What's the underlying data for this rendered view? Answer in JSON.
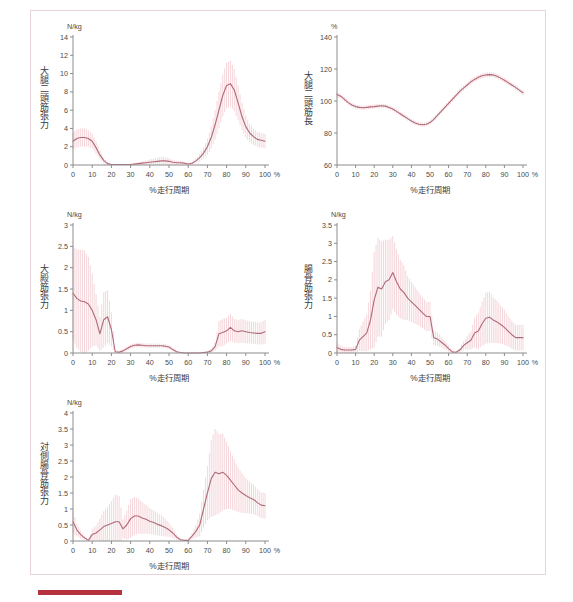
{
  "figure": {
    "accent_color": "#b5333f",
    "line_color": "#b06a78",
    "error_color": "#f0c8cf",
    "axis_color": "#8c8c8c",
    "xlabel": "%走行周期",
    "x_unit_suffix": "%",
    "x_ticks": [
      0,
      10,
      20,
      30,
      40,
      50,
      60,
      70,
      80,
      90,
      100
    ]
  },
  "chart_data": [
    {
      "id": "biceps-femoris-force",
      "type": "line",
      "title": "大腿二頭筋張力",
      "ylabel": "大腿二頭筋張力",
      "xlabel": "%走行周期",
      "yunit": "N/kg",
      "ylim": [
        0,
        14
      ],
      "y_ticks": [
        0,
        2,
        4,
        6,
        8,
        10,
        12,
        14
      ],
      "xlim": [
        0,
        100
      ],
      "grid": false,
      "legend": "none",
      "x": [
        0,
        2,
        4,
        6,
        8,
        10,
        12,
        14,
        16,
        18,
        20,
        22,
        24,
        26,
        28,
        30,
        32,
        34,
        36,
        38,
        40,
        42,
        44,
        46,
        48,
        50,
        52,
        54,
        56,
        58,
        60,
        62,
        64,
        66,
        68,
        70,
        72,
        74,
        76,
        78,
        80,
        82,
        84,
        86,
        88,
        90,
        92,
        94,
        96,
        98,
        100
      ],
      "mean": [
        2.6,
        2.9,
        3.0,
        3.0,
        2.9,
        2.6,
        1.9,
        1.1,
        0.5,
        0.15,
        0.05,
        0.05,
        0.05,
        0.05,
        0.05,
        0.05,
        0.1,
        0.15,
        0.2,
        0.25,
        0.3,
        0.35,
        0.4,
        0.45,
        0.45,
        0.4,
        0.3,
        0.25,
        0.25,
        0.2,
        0.1,
        0.2,
        0.45,
        0.8,
        1.3,
        2.0,
        3.0,
        4.4,
        6.0,
        7.6,
        8.7,
        8.9,
        8.2,
        6.8,
        5.3,
        4.2,
        3.5,
        3.1,
        2.8,
        2.7,
        2.6
      ],
      "err": [
        0.9,
        1.0,
        1.0,
        1.0,
        0.9,
        0.8,
        0.7,
        0.5,
        0.3,
        0.15,
        0.05,
        0.05,
        0.05,
        0.05,
        0.05,
        0.05,
        0.1,
        0.15,
        0.2,
        0.25,
        0.3,
        0.35,
        0.4,
        0.45,
        0.4,
        0.35,
        0.25,
        0.2,
        0.2,
        0.15,
        0.1,
        0.15,
        0.25,
        0.4,
        0.6,
        0.9,
        1.2,
        1.6,
        2.0,
        2.3,
        2.5,
        2.5,
        2.3,
        1.9,
        1.5,
        1.2,
        1.0,
        0.9,
        0.8,
        0.8,
        0.8
      ]
    },
    {
      "id": "biceps-femoris-length",
      "type": "line",
      "title": "大腿二頭筋長",
      "ylabel": "大腿二頭筋長",
      "xlabel": "%走行周期",
      "yunit": "%",
      "ylim": [
        60,
        140
      ],
      "y_ticks": [
        60,
        80,
        100,
        120,
        140
      ],
      "xlim": [
        0,
        100
      ],
      "grid": false,
      "legend": "none",
      "x": [
        0,
        2,
        4,
        6,
        8,
        10,
        12,
        14,
        16,
        18,
        20,
        22,
        24,
        26,
        28,
        30,
        32,
        34,
        36,
        38,
        40,
        42,
        44,
        46,
        48,
        50,
        52,
        54,
        56,
        58,
        60,
        62,
        64,
        66,
        68,
        70,
        72,
        74,
        76,
        78,
        80,
        82,
        84,
        86,
        88,
        90,
        92,
        94,
        96,
        98,
        100
      ],
      "mean": [
        104,
        103,
        101,
        99,
        97.5,
        96.5,
        96,
        95.8,
        96,
        96.3,
        96.5,
        96.8,
        97,
        96.8,
        96,
        95,
        93.5,
        92,
        90.5,
        89,
        87.5,
        86.3,
        85.5,
        85.2,
        85.5,
        86.5,
        88.5,
        91,
        93.5,
        96,
        98.5,
        101,
        103.5,
        106,
        108,
        110,
        112,
        113.5,
        114.8,
        115.8,
        116.3,
        116.5,
        116.3,
        115.5,
        114.3,
        113,
        111.5,
        110,
        108.5,
        106.8,
        105.2
      ],
      "err": [
        1.6,
        1.5,
        1.4,
        1.4,
        1.3,
        1.3,
        1.3,
        1.3,
        1.3,
        1.3,
        1.3,
        1.3,
        1.3,
        1.3,
        1.3,
        1.3,
        1.3,
        1.3,
        1.3,
        1.3,
        1.3,
        1.3,
        1.3,
        1.3,
        1.3,
        1.3,
        1.4,
        1.4,
        1.5,
        1.5,
        1.5,
        1.6,
        1.6,
        1.6,
        1.6,
        1.6,
        1.6,
        1.6,
        1.6,
        1.6,
        1.6,
        1.6,
        1.6,
        1.6,
        1.5,
        1.5,
        1.5,
        1.4,
        1.4,
        1.4,
        1.4
      ]
    },
    {
      "id": "gluteus-maximus-force",
      "type": "line",
      "title": "大殿筋張力",
      "ylabel": "大殿筋張力",
      "xlabel": "%走行周期",
      "yunit": "N/kg",
      "ylim": [
        0,
        3
      ],
      "y_ticks": [
        0,
        0.5,
        1,
        1.5,
        2,
        2.5,
        3
      ],
      "xlim": [
        0,
        100
      ],
      "grid": false,
      "legend": "none",
      "x": [
        0,
        2,
        4,
        6,
        8,
        10,
        12,
        14,
        16,
        18,
        20,
        22,
        24,
        26,
        28,
        30,
        32,
        34,
        36,
        38,
        40,
        42,
        44,
        46,
        48,
        50,
        52,
        54,
        56,
        58,
        60,
        62,
        64,
        66,
        68,
        70,
        72,
        74,
        76,
        78,
        80,
        82,
        84,
        86,
        88,
        90,
        92,
        94,
        96,
        98,
        100
      ],
      "mean": [
        1.4,
        1.28,
        1.22,
        1.2,
        1.15,
        1.0,
        0.78,
        0.45,
        0.78,
        0.85,
        0.55,
        0.03,
        0.02,
        0.05,
        0.1,
        0.15,
        0.18,
        0.19,
        0.18,
        0.17,
        0.17,
        0.17,
        0.17,
        0.17,
        0.16,
        0.14,
        0.08,
        0.03,
        0.01,
        0.0,
        0.0,
        0.0,
        0.0,
        0.0,
        0.01,
        0.02,
        0.05,
        0.15,
        0.45,
        0.48,
        0.52,
        0.6,
        0.52,
        0.5,
        0.52,
        0.5,
        0.48,
        0.47,
        0.46,
        0.46,
        0.5
      ],
      "err": [
        1.1,
        1.15,
        1.2,
        1.2,
        1.1,
        0.85,
        0.6,
        0.4,
        0.65,
        0.62,
        0.4,
        0.04,
        0.03,
        0.04,
        0.05,
        0.05,
        0.05,
        0.05,
        0.05,
        0.05,
        0.05,
        0.05,
        0.05,
        0.05,
        0.05,
        0.05,
        0.04,
        0.02,
        0.01,
        0.0,
        0.0,
        0.0,
        0.0,
        0.0,
        0.01,
        0.02,
        0.04,
        0.1,
        0.3,
        0.32,
        0.3,
        0.32,
        0.28,
        0.27,
        0.28,
        0.27,
        0.26,
        0.26,
        0.26,
        0.26,
        0.28
      ]
    },
    {
      "id": "iliacus-force",
      "type": "line",
      "title": "腸骨筋張力",
      "ylabel": "腸骨筋張力",
      "xlabel": "%走行周期",
      "yunit": "N/kg",
      "ylim": [
        0,
        3.5
      ],
      "y_ticks": [
        0,
        0.5,
        1,
        1.5,
        2,
        2.5,
        3,
        3.5
      ],
      "xlim": [
        0,
        100
      ],
      "grid": false,
      "legend": "none",
      "x": [
        0,
        2,
        4,
        6,
        8,
        10,
        12,
        14,
        16,
        18,
        20,
        22,
        24,
        26,
        28,
        30,
        32,
        34,
        36,
        38,
        40,
        42,
        44,
        46,
        48,
        50,
        52,
        54,
        56,
        58,
        60,
        62,
        64,
        66,
        68,
        70,
        72,
        74,
        76,
        78,
        80,
        82,
        84,
        86,
        88,
        90,
        92,
        94,
        96,
        98,
        100
      ],
      "mean": [
        0.15,
        0.1,
        0.08,
        0.08,
        0.08,
        0.1,
        0.35,
        0.45,
        0.55,
        0.9,
        1.45,
        1.8,
        1.75,
        1.95,
        2.0,
        2.2,
        1.95,
        1.75,
        1.65,
        1.5,
        1.4,
        1.3,
        1.2,
        1.1,
        1.0,
        1.0,
        0.42,
        0.38,
        0.3,
        0.22,
        0.12,
        0.03,
        0.02,
        0.08,
        0.2,
        0.28,
        0.35,
        0.55,
        0.6,
        0.8,
        0.95,
        0.98,
        0.9,
        0.85,
        0.78,
        0.7,
        0.6,
        0.5,
        0.42,
        0.42,
        0.42
      ],
      "err": [
        0.12,
        0.1,
        0.08,
        0.08,
        0.08,
        0.1,
        0.3,
        0.4,
        0.5,
        0.8,
        1.3,
        1.35,
        1.3,
        1.15,
        1.1,
        1.0,
        0.9,
        0.8,
        0.75,
        0.6,
        0.55,
        0.5,
        0.45,
        0.42,
        0.4,
        0.4,
        0.2,
        0.18,
        0.15,
        0.12,
        0.08,
        0.03,
        0.02,
        0.06,
        0.12,
        0.18,
        0.25,
        0.4,
        0.5,
        0.6,
        0.7,
        0.7,
        0.62,
        0.58,
        0.52,
        0.48,
        0.42,
        0.38,
        0.35,
        0.35,
        0.35
      ]
    },
    {
      "id": "contralateral-iliacus-force",
      "type": "line",
      "title": "対側腸骨筋張力",
      "ylabel": "対側腸骨筋張力",
      "xlabel": "%走行周期",
      "yunit": "N/kg",
      "ylim": [
        0,
        4
      ],
      "y_ticks": [
        0,
        0.5,
        1,
        1.5,
        2,
        2.5,
        3,
        3.5,
        4
      ],
      "xlim": [
        0,
        100
      ],
      "grid": false,
      "legend": "none",
      "x": [
        0,
        2,
        4,
        6,
        8,
        10,
        12,
        14,
        16,
        18,
        20,
        22,
        24,
        26,
        28,
        30,
        32,
        34,
        36,
        38,
        40,
        42,
        44,
        46,
        48,
        50,
        52,
        54,
        56,
        58,
        60,
        62,
        64,
        66,
        68,
        70,
        72,
        74,
        76,
        78,
        80,
        82,
        84,
        86,
        88,
        90,
        92,
        94,
        96,
        98,
        100
      ],
      "mean": [
        0.6,
        0.35,
        0.2,
        0.1,
        0.02,
        0.2,
        0.25,
        0.35,
        0.45,
        0.5,
        0.55,
        0.6,
        0.6,
        0.38,
        0.5,
        0.7,
        0.78,
        0.78,
        0.72,
        0.68,
        0.62,
        0.58,
        0.52,
        0.48,
        0.42,
        0.35,
        0.25,
        0.12,
        0.04,
        0.02,
        0.02,
        0.15,
        0.3,
        0.5,
        1.0,
        1.5,
        1.95,
        2.15,
        2.1,
        2.15,
        2.05,
        1.9,
        1.75,
        1.6,
        1.5,
        1.42,
        1.35,
        1.3,
        1.2,
        1.12,
        1.1
      ],
      "err": [
        0.35,
        0.2,
        0.12,
        0.06,
        0.02,
        0.18,
        0.22,
        0.35,
        0.48,
        0.55,
        0.7,
        0.85,
        0.8,
        0.3,
        0.45,
        0.6,
        0.6,
        0.55,
        0.5,
        0.45,
        0.4,
        0.38,
        0.35,
        0.32,
        0.28,
        0.22,
        0.16,
        0.08,
        0.03,
        0.02,
        0.02,
        0.1,
        0.2,
        0.35,
        0.6,
        0.85,
        1.2,
        1.35,
        1.25,
        1.2,
        1.05,
        0.9,
        0.8,
        0.7,
        0.62,
        0.55,
        0.5,
        0.46,
        0.42,
        0.4,
        0.4
      ]
    }
  ]
}
